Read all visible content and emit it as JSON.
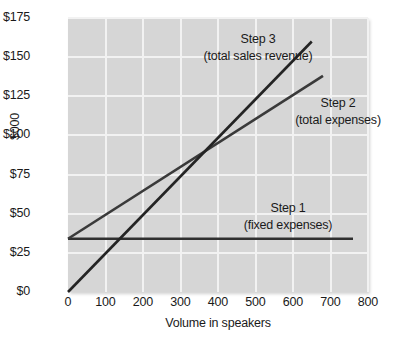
{
  "chart_data": {
    "type": "line",
    "title": "",
    "subtitle": "",
    "xlabel": "Volume in speakers",
    "ylabel": "$000",
    "xlim": [
      0,
      800
    ],
    "ylim": [
      0,
      175
    ],
    "grid": true,
    "legend_position": "inline-annotations",
    "xticks": [
      "0",
      "100",
      "200",
      "300",
      "400",
      "500",
      "600",
      "700",
      "800"
    ],
    "xtick_values": [
      0,
      100,
      200,
      300,
      400,
      500,
      600,
      700,
      800
    ],
    "yticks": [
      "$0",
      "$25",
      "$50",
      "$75",
      "$100",
      "$125",
      "$150",
      "$175"
    ],
    "ytick_values": [
      0,
      25,
      50,
      75,
      100,
      125,
      150,
      175
    ],
    "series": [
      {
        "name": "Step 1 (fixed expenses)",
        "label_main": "Step 1",
        "label_sub": "(fixed expenses)",
        "x": [
          0,
          760
        ],
        "values": [
          34,
          34
        ],
        "color": "#303030"
      },
      {
        "name": "Step 2 (total expenses)",
        "label_main": "Step 2",
        "label_sub": "(total expenses)",
        "x": [
          0,
          680
        ],
        "values": [
          34,
          138
        ],
        "color": "#3a3a3a"
      },
      {
        "name": "Step 3 (total sales revenue)",
        "label_main": "Step 3",
        "label_sub": "(total sales revenue)",
        "x": [
          0,
          650
        ],
        "values": [
          0,
          160
        ],
        "color": "#242424"
      }
    ],
    "annotations": [
      {
        "text": "Step 3",
        "sub": "(total sales revenue)"
      },
      {
        "text": "Step 2",
        "sub": "(total expenses)"
      },
      {
        "text": "Step 1",
        "sub": "(fixed expenses)"
      }
    ],
    "colors": {
      "plot_background": "#d6d6d6",
      "gridline": "#f2f2f2",
      "text": "#1a1a1a",
      "line": "#2e2e2e"
    }
  }
}
